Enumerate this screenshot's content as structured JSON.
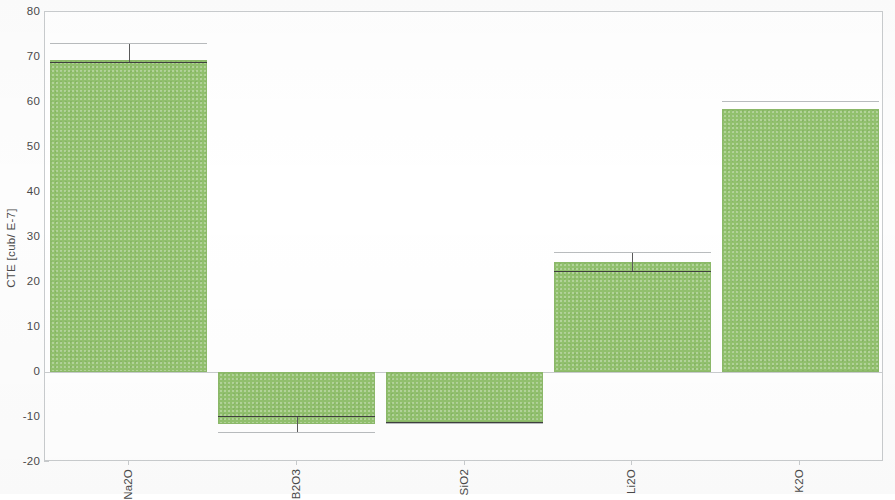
{
  "chart_data": {
    "type": "bar",
    "title": "",
    "subtitle": "",
    "xlabel": "",
    "ylabel": "CTE [cub/ E-7]",
    "categories": [
      "Na2O",
      "B2O3",
      "SiO2",
      "Li2O",
      "K2O"
    ],
    "values": [
      69.3,
      -11.5,
      -11.1,
      24.4,
      58.4
    ],
    "errors_upper": [
      3.8,
      0.0,
      0.0,
      2.2,
      1.8
    ],
    "errors_lower": [
      0.7,
      1.8,
      0.2,
      0.0,
      0.0
    ],
    "error_marker_values": [
      68.9,
      -9.8,
      -11.0,
      22.4,
      60.2
    ],
    "ylim": [
      -20,
      80
    ],
    "yticks": [
      -20,
      -10,
      0,
      10,
      20,
      30,
      40,
      50,
      60,
      70,
      80
    ],
    "ytick_labels": [
      "-20",
      "-10",
      "0",
      "10",
      "20",
      "30",
      "40",
      "50",
      "60",
      "70",
      "80"
    ],
    "grid": false,
    "legend": false,
    "legend_position": "none",
    "bar_color": "#92c16e",
    "bar_edge_color": "#8cb96a",
    "axis_color": "#c9ccce",
    "text_color": "#4a4a4a",
    "error_bar_color": "#3f3f3f",
    "zero_line": 0,
    "series": [
      {
        "name": "CTE",
        "values": [
          69.3,
          -11.5,
          -11.1,
          24.4,
          58.4
        ]
      }
    ]
  },
  "axes": {
    "y_title": "CTE [cub/ E-7]"
  }
}
